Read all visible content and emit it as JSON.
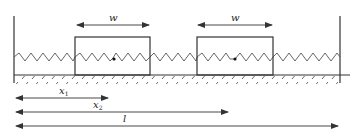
{
  "diagram": {
    "type": "two masses connected by springs between fixed walls",
    "colors": {
      "line": "#333333",
      "spring": "#555555",
      "background": "#ffffff"
    },
    "blocks": [
      {
        "name": "block-1",
        "width_label": "w"
      },
      {
        "name": "block-2",
        "width_label": "w"
      }
    ],
    "dimensions": [
      {
        "name": "x1",
        "label": "x",
        "subscript": "1"
      },
      {
        "name": "x2",
        "label": "x",
        "subscript": "2"
      },
      {
        "name": "l",
        "label": "l",
        "subscript": ""
      }
    ]
  }
}
